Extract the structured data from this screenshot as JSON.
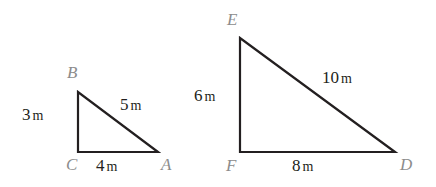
{
  "figure": {
    "background_color": "#ffffff",
    "stroke_color": "#231f20",
    "vertex_label_color": "#8c8c8c",
    "measure_label_color": "#231f20"
  },
  "triangles": [
    {
      "name": "triangle-ABC",
      "vertices": [
        {
          "label": "B",
          "x": 78,
          "y": 92
        },
        {
          "label": "C",
          "x": 78,
          "y": 152
        },
        {
          "label": "A",
          "x": 158,
          "y": 152
        }
      ],
      "sides": [
        {
          "name": "BC",
          "value": "3",
          "unit": "m",
          "text": "3 m"
        },
        {
          "name": "BA",
          "value": "5",
          "unit": "m",
          "text": "5 m"
        },
        {
          "name": "CA",
          "value": "4",
          "unit": "m",
          "text": "4 m"
        }
      ]
    },
    {
      "name": "triangle-DEF",
      "vertices": [
        {
          "label": "E",
          "x": 240,
          "y": 38
        },
        {
          "label": "F",
          "x": 240,
          "y": 152
        },
        {
          "label": "D",
          "x": 395,
          "y": 152
        }
      ],
      "sides": [
        {
          "name": "EF",
          "value": "6",
          "unit": "m",
          "text": "6 m"
        },
        {
          "name": "ED",
          "value": "10",
          "unit": "m",
          "text": "10 m"
        },
        {
          "name": "FD",
          "value": "8",
          "unit": "m",
          "text": "8 m"
        }
      ]
    }
  ],
  "labels": {
    "vertex_B": "B",
    "vertex_C": "C",
    "vertex_A": "A",
    "vertex_E": "E",
    "vertex_F": "F",
    "vertex_D": "D",
    "side_3m_number": "3",
    "side_3m_unit": "m",
    "side_5m_number": "5",
    "side_5m_unit": "m",
    "side_4m_number": "4",
    "side_4m_unit": "m",
    "side_6m_number": "6",
    "side_6m_unit": "m",
    "side_10m_number": "10",
    "side_10m_unit": "m",
    "side_8m_number": "8",
    "side_8m_unit": "m"
  }
}
